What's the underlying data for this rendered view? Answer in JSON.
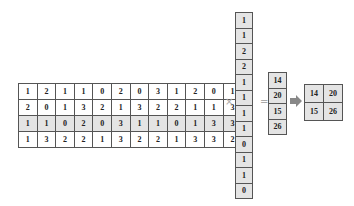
{
  "matrix": {
    "rows": [
      [
        1,
        2,
        1,
        1,
        0,
        2,
        0,
        3,
        1,
        2,
        0,
        1
      ],
      [
        2,
        0,
        1,
        3,
        2,
        1,
        3,
        2,
        2,
        1,
        1,
        3
      ],
      [
        1,
        1,
        0,
        2,
        0,
        3,
        1,
        1,
        0,
        1,
        3,
        3
      ],
      [
        1,
        3,
        2,
        2,
        1,
        3,
        2,
        2,
        1,
        3,
        3,
        2
      ]
    ],
    "shaded_rows": [
      2
    ]
  },
  "vector": [
    1,
    1,
    2,
    2,
    1,
    1,
    1,
    1,
    0,
    1,
    1,
    0
  ],
  "result_vector": [
    14,
    20,
    15,
    26
  ],
  "result_matrix": [
    [
      14,
      20
    ],
    [
      15,
      26
    ]
  ],
  "operators": {
    "multiply": "×",
    "equals": "="
  },
  "arrow_icon": "right-arrow-icon"
}
